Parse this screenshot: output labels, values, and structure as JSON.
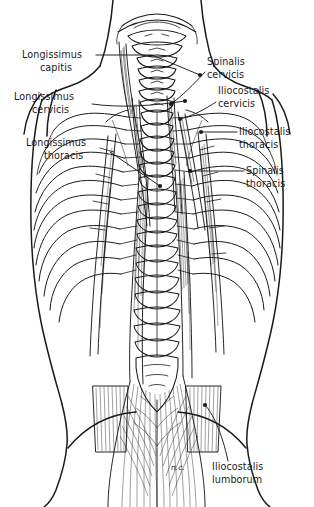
{
  "figure": {
    "view": "posterior",
    "style": "black-and-white line drawing",
    "background_color": "#ffffff",
    "ink_color": "#1a1a1a"
  },
  "labels": [
    {
      "id": "longissimus-capitis",
      "line1": "Longissimus",
      "line2": "capitis",
      "side": "left",
      "text_x": 22,
      "text_y": 58,
      "leader": "M 96 55 L 152 55 L 200 75",
      "dot": {
        "x": 200,
        "y": 75
      }
    },
    {
      "id": "longissimus-cervicis",
      "line1": "Longissimus",
      "line2": "cervicis",
      "side": "left",
      "text_x": 14,
      "text_y": 100,
      "leader": "M 92 104 L 140 102 L 185 101",
      "dot": {
        "x": 185,
        "y": 101
      }
    },
    {
      "id": "longissimus-thoracis",
      "line1": "Longissimus",
      "line2": "thoracis",
      "side": "left",
      "text_x": 26,
      "text_y": 146,
      "leader": "M 110 152 L 160 186",
      "dot": {
        "x": 160,
        "y": 186
      }
    },
    {
      "id": "spinalis-cervicis",
      "line1": "Spinalis",
      "line2": "cervicis",
      "side": "right",
      "text_x": 207,
      "text_y": 65,
      "leader": "M 205 75 L 186 93 L 171 104",
      "dot": {
        "x": 171,
        "y": 104
      }
    },
    {
      "id": "iliocostalis-cervicis",
      "line1": "Iliocostalis",
      "line2": "cervicis",
      "side": "right",
      "text_x": 218,
      "text_y": 94,
      "leader": "M 216 104 L 196 113 L 180 119",
      "dot": {
        "x": 180,
        "y": 119
      }
    },
    {
      "id": "iliocostalis-thoracis",
      "line1": "Iliocostalis",
      "line2": "thoracis",
      "side": "right",
      "text_x": 239,
      "text_y": 135,
      "leader": "M 237 132 L 201 132",
      "dot": {
        "x": 201,
        "y": 132
      }
    },
    {
      "id": "spinalis-thoracis",
      "line1": "Spinalis",
      "line2": "thoracis",
      "side": "right",
      "text_x": 246,
      "text_y": 174,
      "leader": "M 244 171 L 190 171",
      "dot": {
        "x": 190,
        "y": 171
      }
    },
    {
      "id": "iliocostalis-lumborum",
      "line1": "Iliocostalis",
      "line2": "lumborum",
      "side": "right",
      "text_x": 212,
      "text_y": 470,
      "leader": "M 228 461 L 205 405",
      "dot": {
        "x": 205,
        "y": 405
      }
    }
  ],
  "annotations": [
    {
      "id": "nc-marking",
      "text": "n.c.",
      "x": 171,
      "y": 470
    }
  ],
  "anatomy": {
    "regions": [
      "occiput",
      "cervical vertebrae",
      "thoracic vertebrae",
      "rib cage",
      "lumbar vertebrae",
      "sacrum",
      "iliac crest"
    ],
    "rib_pairs": 12,
    "cervical_vertebrae": 7,
    "muscle_groups": [
      "longissimus",
      "iliocostalis",
      "spinalis"
    ]
  }
}
